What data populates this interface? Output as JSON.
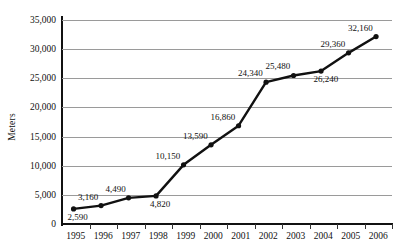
{
  "chart_data": {
    "type": "line",
    "title": "",
    "subtitle": "",
    "xlabel": "",
    "ylabel": "Meters",
    "categories": [
      "1995",
      "1996",
      "1997",
      "1998",
      "1999",
      "2000",
      "2001",
      "2002",
      "2003",
      "2004",
      "2005",
      "2006"
    ],
    "values": [
      2590,
      3160,
      4490,
      4820,
      10150,
      13590,
      16860,
      24340,
      25480,
      26240,
      29360,
      32160
    ],
    "point_labels": [
      "2,590",
      "3,160",
      "4,490",
      "4,820",
      "10,150",
      "13,590",
      "16,860",
      "24,340",
      "25,480",
      "26,240",
      "29,360",
      "32,160"
    ],
    "ylim": [
      0,
      35000
    ],
    "ytick_values": [
      0,
      5000,
      10000,
      15000,
      20000,
      25000,
      30000,
      35000
    ],
    "ytick_labels": [
      "0",
      "5,000",
      "10,000",
      "15,000",
      "20,000",
      "25,000",
      "30,000",
      "35,000"
    ],
    "grid": true,
    "grid_axis": "y",
    "legend": false,
    "legend_position": "none",
    "series_color": "#111111",
    "grid_color": "#9a9a9a",
    "axis_color": "#111111",
    "marker": "circle",
    "label_placement": [
      "below-right",
      "above-left",
      "above-left",
      "below-right",
      "above-left",
      "above-left",
      "above-left",
      "above-left",
      "above-left",
      "below-right",
      "above-left",
      "above-left"
    ]
  }
}
